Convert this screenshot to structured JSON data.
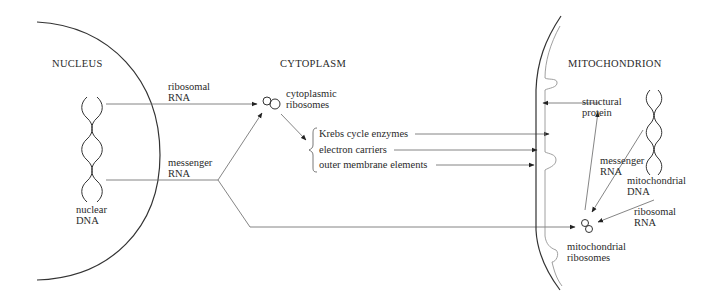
{
  "regions": {
    "nucleus": "NUCLEUS",
    "cytoplasm": "CYTOPLASM",
    "mitochondrion": "MITOCHONDRION"
  },
  "nucleus_labels": {
    "nuclear_dna_1": "nuclear",
    "nuclear_dna_2": "DNA",
    "ribosomal_rna_1": "ribosomal",
    "ribosomal_rna_2": "RNA",
    "messenger_rna_1": "messenger",
    "messenger_rna_2": "RNA"
  },
  "cytoplasm_labels": {
    "cyto_ribosomes_1": "cytoplasmic",
    "cyto_ribosomes_2": "ribosomes",
    "products": [
      "Krebs cycle enzymes",
      "electron carriers",
      "outer membrane elements"
    ]
  },
  "mito_labels": {
    "structural_protein_1": "structural",
    "structural_protein_2": "protein",
    "messenger_rna_1": "messenger",
    "messenger_rna_2": "RNA",
    "mito_dna_1": "mitochondrial",
    "mito_dna_2": "DNA",
    "ribosomal_rna_1": "ribosomal",
    "ribosomal_rna_2": "RNA",
    "mito_ribosomes_1": "mitochondrial",
    "mito_ribosomes_2": "ribosomes"
  }
}
